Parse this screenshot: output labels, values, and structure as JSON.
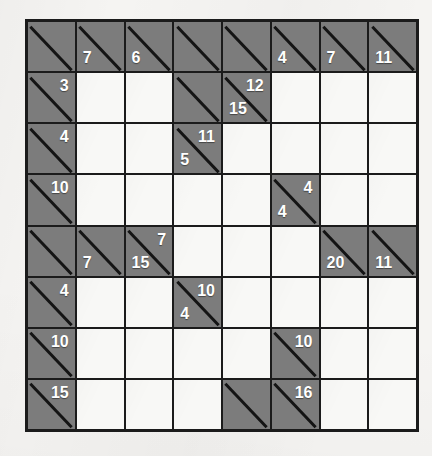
{
  "puzzle": {
    "type": "kakuro",
    "rows": 8,
    "cols": 8,
    "colors": {
      "paper": "#f5f4f2",
      "clue_cell": "#7c7c7c",
      "entry_cell": "#f8f8f6",
      "grid_line": "#1b1b1b",
      "clue_text": "#ffffff"
    },
    "cells": [
      [
        {
          "kind": "clue",
          "across": "",
          "down": ""
        },
        {
          "kind": "clue",
          "across": "",
          "down": "7"
        },
        {
          "kind": "clue",
          "across": "",
          "down": "6"
        },
        {
          "kind": "clue",
          "across": "",
          "down": ""
        },
        {
          "kind": "clue",
          "across": "",
          "down": ""
        },
        {
          "kind": "clue",
          "across": "",
          "down": "4"
        },
        {
          "kind": "clue",
          "across": "",
          "down": "7"
        },
        {
          "kind": "clue",
          "across": "",
          "down": "11"
        }
      ],
      [
        {
          "kind": "clue",
          "across": "3",
          "down": ""
        },
        {
          "kind": "entry",
          "value": ""
        },
        {
          "kind": "entry",
          "value": ""
        },
        {
          "kind": "clue",
          "across": "",
          "down": ""
        },
        {
          "kind": "clue",
          "across": "12",
          "down": "15"
        },
        {
          "kind": "entry",
          "value": ""
        },
        {
          "kind": "entry",
          "value": ""
        },
        {
          "kind": "entry",
          "value": ""
        }
      ],
      [
        {
          "kind": "clue",
          "across": "4",
          "down": ""
        },
        {
          "kind": "entry",
          "value": ""
        },
        {
          "kind": "entry",
          "value": ""
        },
        {
          "kind": "clue",
          "across": "11",
          "down": "5"
        },
        {
          "kind": "entry",
          "value": ""
        },
        {
          "kind": "entry",
          "value": ""
        },
        {
          "kind": "entry",
          "value": ""
        },
        {
          "kind": "entry",
          "value": ""
        }
      ],
      [
        {
          "kind": "clue",
          "across": "10",
          "down": ""
        },
        {
          "kind": "entry",
          "value": ""
        },
        {
          "kind": "entry",
          "value": ""
        },
        {
          "kind": "entry",
          "value": ""
        },
        {
          "kind": "entry",
          "value": ""
        },
        {
          "kind": "clue",
          "across": "4",
          "down": "4"
        },
        {
          "kind": "entry",
          "value": ""
        },
        {
          "kind": "entry",
          "value": ""
        }
      ],
      [
        {
          "kind": "clue",
          "across": "",
          "down": ""
        },
        {
          "kind": "clue",
          "across": "",
          "down": "7"
        },
        {
          "kind": "clue",
          "across": "7",
          "down": "15"
        },
        {
          "kind": "entry",
          "value": ""
        },
        {
          "kind": "entry",
          "value": ""
        },
        {
          "kind": "entry",
          "value": ""
        },
        {
          "kind": "clue",
          "across": "",
          "down": "20"
        },
        {
          "kind": "clue",
          "across": "",
          "down": "11"
        }
      ],
      [
        {
          "kind": "clue",
          "across": "4",
          "down": ""
        },
        {
          "kind": "entry",
          "value": ""
        },
        {
          "kind": "entry",
          "value": ""
        },
        {
          "kind": "clue",
          "across": "10",
          "down": "4"
        },
        {
          "kind": "entry",
          "value": ""
        },
        {
          "kind": "entry",
          "value": ""
        },
        {
          "kind": "entry",
          "value": ""
        },
        {
          "kind": "entry",
          "value": ""
        }
      ],
      [
        {
          "kind": "clue",
          "across": "10",
          "down": ""
        },
        {
          "kind": "entry",
          "value": ""
        },
        {
          "kind": "entry",
          "value": ""
        },
        {
          "kind": "entry",
          "value": ""
        },
        {
          "kind": "entry",
          "value": ""
        },
        {
          "kind": "clue",
          "across": "10",
          "down": ""
        },
        {
          "kind": "entry",
          "value": ""
        },
        {
          "kind": "entry",
          "value": ""
        }
      ],
      [
        {
          "kind": "clue",
          "across": "15",
          "down": ""
        },
        {
          "kind": "entry",
          "value": ""
        },
        {
          "kind": "entry",
          "value": ""
        },
        {
          "kind": "entry",
          "value": ""
        },
        {
          "kind": "clue",
          "across": "",
          "down": ""
        },
        {
          "kind": "clue",
          "across": "16",
          "down": ""
        },
        {
          "kind": "entry",
          "value": ""
        },
        {
          "kind": "entry",
          "value": ""
        }
      ]
    ]
  }
}
